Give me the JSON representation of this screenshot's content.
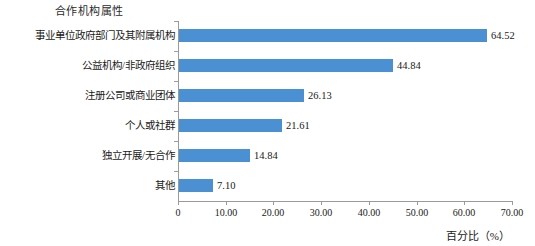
{
  "chart_data": {
    "type": "bar",
    "orientation": "horizontal",
    "title": "合作机构属性",
    "xlabel": "百分比（%）",
    "ylabel": "",
    "categories": [
      "事业单位政府部门及其附属机构",
      "公益机构/非政府组织",
      "注册公司或商业团体",
      "个人或社群",
      "独立开展/无合作",
      "其他"
    ],
    "values": [
      64.52,
      44.84,
      26.13,
      21.61,
      14.84,
      7.1
    ],
    "value_labels": [
      "64.52",
      "44.84",
      "26.13",
      "21.61",
      "14.84",
      "7.10"
    ],
    "xlim": [
      0,
      70
    ],
    "xticks": [
      0,
      10,
      20,
      30,
      40,
      50,
      60,
      70
    ],
    "xtick_labels": [
      "0",
      "10.00",
      "20.00",
      "30.00",
      "40.00",
      "50.00",
      "60.00",
      "70.00"
    ],
    "grid": false,
    "legend": false,
    "bar_color": "#4a90d2",
    "axis_color": "#9a9a9a",
    "background": "#ffffff"
  }
}
